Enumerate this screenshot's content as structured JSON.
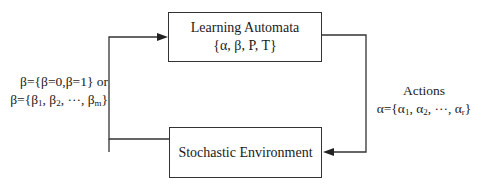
{
  "diagram": {
    "type": "feedback-loop",
    "nodes": {
      "automata": {
        "title": "Learning Automata",
        "subtitle": "{α, β, P, T}"
      },
      "environment": {
        "title": "Stochastic Environment"
      }
    },
    "edges": [
      {
        "from": "automata",
        "to": "environment",
        "label": "actions"
      },
      {
        "from": "environment",
        "to": "automata",
        "label": "response"
      }
    ],
    "labels": {
      "response_line1": "β={β=0,β=1} or",
      "response_line2_prefix": "β={β",
      "response_sub1": "1",
      "response_sep1": ", β",
      "response_sub2": "2",
      "response_sep2": ", ···, β",
      "response_subm": "m",
      "response_close": "}",
      "actions_title": "Actions",
      "actions_prefix": "α={α",
      "actions_sub1": "1",
      "actions_sep1": ", α",
      "actions_sub2": "2",
      "actions_sep2": ", ···, α",
      "actions_subr": "r",
      "actions_close": "}"
    },
    "colors": {
      "line": "#333333",
      "text": "#1a1a1a",
      "background": "#ffffff"
    }
  }
}
